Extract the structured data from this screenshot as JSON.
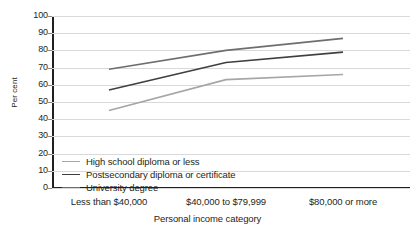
{
  "chart_data": {
    "type": "line",
    "title": "",
    "xlabel": "Personal income category",
    "ylabel": "Per cent",
    "categories": [
      "Less than $40,000",
      "$40,000 to $79,999",
      "$80,000 or more"
    ],
    "ylim": [
      0,
      100
    ],
    "yticks": [
      0,
      10,
      20,
      30,
      40,
      50,
      60,
      70,
      80,
      90,
      100
    ],
    "grid": true,
    "legend_position": "inside-bottom-left",
    "series": [
      {
        "name": "High school diploma or less",
        "values": [
          45,
          63,
          66
        ],
        "color": "#a6a6a6"
      },
      {
        "name": "Postsecondary diploma or certificate",
        "values": [
          57,
          73,
          79
        ],
        "color": "#3f3f3f"
      },
      {
        "name": "University degree",
        "values": [
          69,
          80,
          87
        ],
        "color": "#6e6e6e"
      }
    ]
  },
  "axes": {
    "ylabel": "Per cent",
    "xlabel": "Personal income category",
    "ytick_labels": [
      "100",
      "90",
      "80",
      "70",
      "60",
      "50",
      "40",
      "30",
      "20",
      "10",
      "0"
    ],
    "xtick_labels": [
      "Less than $40,000",
      "$40,000 to $79,999",
      "$80,000 or more"
    ]
  },
  "legend": {
    "items": [
      {
        "label": "High school diploma or less"
      },
      {
        "label": "Postsecondary diploma or certificate"
      },
      {
        "label": "University degree"
      }
    ]
  },
  "colors": {
    "grid": "#d9d9d9",
    "axis": "#231f20",
    "text": "#231f20",
    "background": "#ffffff"
  }
}
